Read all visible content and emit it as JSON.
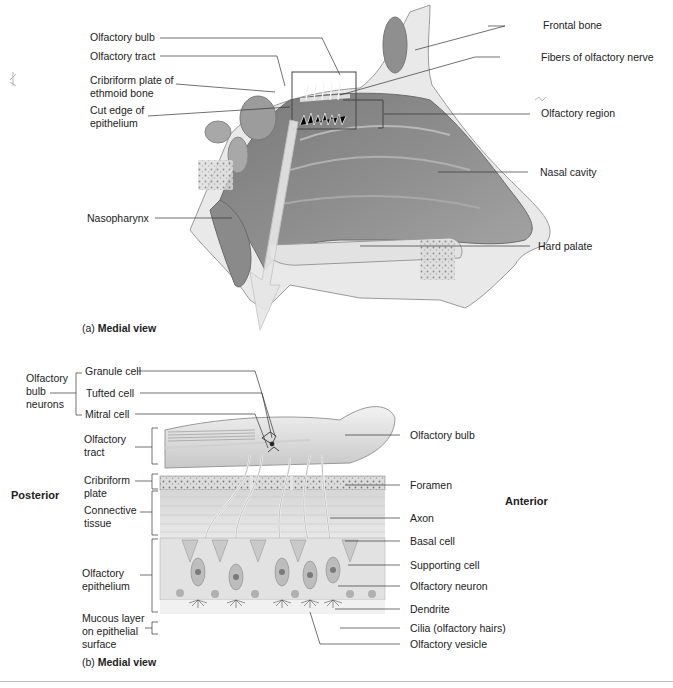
{
  "panel_a": {
    "caption_prefix": "(a)",
    "caption_view": "Medial view",
    "labels_left": [
      {
        "text": "Olfactory bulb"
      },
      {
        "text": "Olfactory tract"
      },
      {
        "text": "Cribriform plate of ethmoid bone"
      },
      {
        "text": "Cut edge of epithelium"
      },
      {
        "text": "Nasopharynx"
      }
    ],
    "labels_right": [
      {
        "text": "Frontal bone"
      },
      {
        "text": "Fibers of olfactory nerve"
      },
      {
        "text": "Olfactory region"
      },
      {
        "text": "Nasal cavity"
      },
      {
        "text": "Hard palate"
      }
    ]
  },
  "panel_b": {
    "caption_prefix": "(b)",
    "caption_view": "Medial view",
    "orientation": {
      "left": "Posterior",
      "right": "Anterior"
    },
    "group_label": "Olfactory bulb neurons",
    "neuron_labels": [
      {
        "text": "Granule cell"
      },
      {
        "text": "Tufted cell"
      },
      {
        "text": "Mitral cell"
      }
    ],
    "layer_labels": [
      {
        "text": "Olfactory tract"
      },
      {
        "text": "Cribriform plate"
      },
      {
        "text": "Connective tissue"
      },
      {
        "text": "Olfactory epithelium"
      },
      {
        "text": "Mucous layer on epithelial surface"
      }
    ],
    "labels_right": [
      {
        "text": "Olfactory bulb"
      },
      {
        "text": "Foramen"
      },
      {
        "text": "Axon"
      },
      {
        "text": "Basal cell"
      },
      {
        "text": "Supporting cell"
      },
      {
        "text": "Olfactory neuron"
      },
      {
        "text": "Dendrite"
      },
      {
        "text": "Cilia (olfactory hairs)"
      },
      {
        "text": "Olfactory vesicle"
      }
    ]
  }
}
